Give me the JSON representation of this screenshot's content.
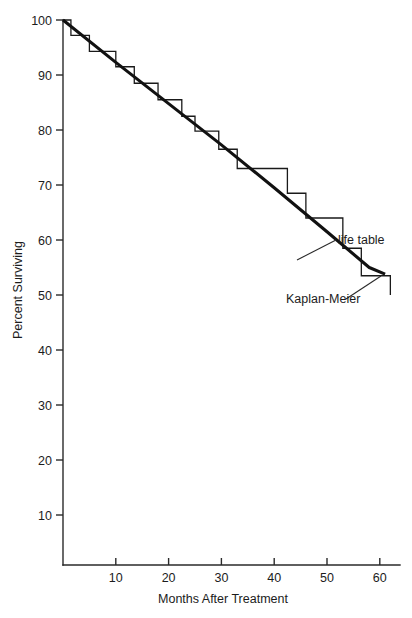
{
  "chart_data": {
    "type": "line",
    "title": "",
    "xlabel": "Months After Treatment",
    "ylabel": "Percent Surviving",
    "xlim": [
      0,
      63
    ],
    "ylim": [
      0,
      100
    ],
    "grid": false,
    "legend_position": "inline-annotations",
    "xticks": [
      10,
      20,
      30,
      40,
      50,
      60
    ],
    "xtick_labels": [
      "10",
      "20",
      "30",
      "40",
      "50",
      "60"
    ],
    "yticks": [
      10,
      20,
      30,
      40,
      50,
      60,
      70,
      80,
      90,
      100
    ],
    "ytick_labels": [
      "10",
      "20",
      "30",
      "40",
      "50",
      "60",
      "70",
      "80",
      "90",
      "100"
    ],
    "annotations": [
      {
        "text": "life table",
        "x": 54.5,
        "y": 61.5
      },
      {
        "text": "Kaplan-Meier",
        "x": 41.0,
        "y": 47.5
      }
    ],
    "series": [
      {
        "name": "Kaplan-Meier",
        "style": "step",
        "points": [
          {
            "x": 0,
            "y": 100.0
          },
          {
            "x": 1.5,
            "y": 100.0
          },
          {
            "x": 1.5,
            "y": 97.2
          },
          {
            "x": 5.0,
            "y": 97.2
          },
          {
            "x": 5.0,
            "y": 94.3
          },
          {
            "x": 10.0,
            "y": 94.3
          },
          {
            "x": 10.0,
            "y": 91.5
          },
          {
            "x": 13.5,
            "y": 91.5
          },
          {
            "x": 13.5,
            "y": 88.5
          },
          {
            "x": 18.0,
            "y": 88.5
          },
          {
            "x": 18.0,
            "y": 85.5
          },
          {
            "x": 22.5,
            "y": 85.5
          },
          {
            "x": 22.5,
            "y": 82.5
          },
          {
            "x": 25.0,
            "y": 82.5
          },
          {
            "x": 25.0,
            "y": 79.8
          },
          {
            "x": 29.5,
            "y": 79.8
          },
          {
            "x": 29.5,
            "y": 76.5
          },
          {
            "x": 33.0,
            "y": 76.5
          },
          {
            "x": 33.0,
            "y": 73.0
          },
          {
            "x": 42.5,
            "y": 73.0
          },
          {
            "x": 42.5,
            "y": 68.5
          },
          {
            "x": 46.0,
            "y": 68.5
          },
          {
            "x": 46.0,
            "y": 64.0
          },
          {
            "x": 53.0,
            "y": 64.0
          },
          {
            "x": 53.0,
            "y": 58.5
          },
          {
            "x": 56.5,
            "y": 58.5
          },
          {
            "x": 56.5,
            "y": 53.5
          },
          {
            "x": 62.0,
            "y": 53.5
          },
          {
            "x": 62.0,
            "y": 50.0
          }
        ]
      },
      {
        "name": "life table",
        "style": "smooth",
        "points": [
          {
            "x": 0,
            "y": 100.0
          },
          {
            "x": 10.0,
            "y": 92.3
          },
          {
            "x": 20.0,
            "y": 84.8
          },
          {
            "x": 30.0,
            "y": 77.3
          },
          {
            "x": 40.0,
            "y": 69.5
          },
          {
            "x": 50.0,
            "y": 61.5
          },
          {
            "x": 58.0,
            "y": 55.0
          },
          {
            "x": 61.0,
            "y": 53.8
          }
        ]
      }
    ]
  },
  "icons": {
    "y_axis_rotation": "rotated-text-icon"
  }
}
